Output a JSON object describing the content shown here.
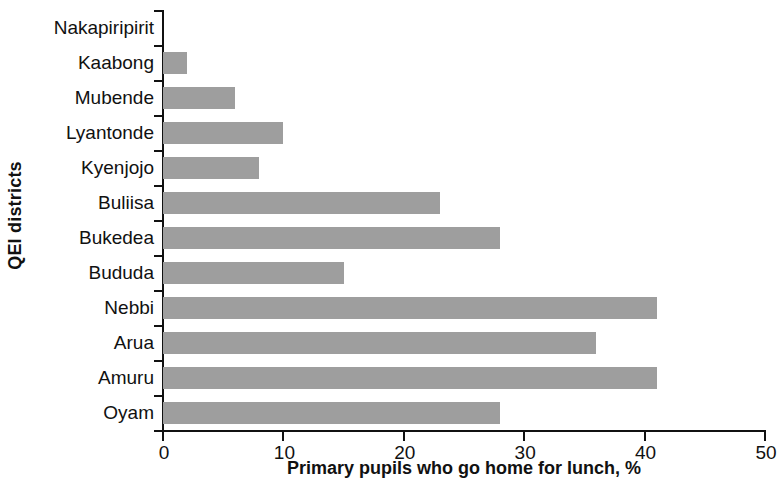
{
  "chart_data": {
    "type": "bar",
    "orientation": "horizontal",
    "title": "",
    "xlabel": "Primary pupils who go home for lunch, %",
    "ylabel": "QEI districts",
    "categories": [
      "Nakapiripirit",
      "Kaabong",
      "Mubende",
      "Lyantonde",
      "Kyenjojo",
      "Buliisa",
      "Bukedea",
      "Bududa",
      "Nebbi",
      "Arua",
      "Amuru",
      "Oyam"
    ],
    "values": [
      0,
      2,
      6,
      10,
      8,
      23,
      28,
      15,
      41,
      36,
      41,
      28
    ],
    "xlim": [
      0,
      50
    ],
    "xticks": [
      0,
      10,
      20,
      30,
      40,
      50
    ],
    "xtick_labels": [
      "0",
      "10",
      "20",
      "30",
      "40",
      "50"
    ],
    "grid": false,
    "legend": false,
    "bar_color": "#9e9e9e",
    "axis_color": "#111111"
  }
}
